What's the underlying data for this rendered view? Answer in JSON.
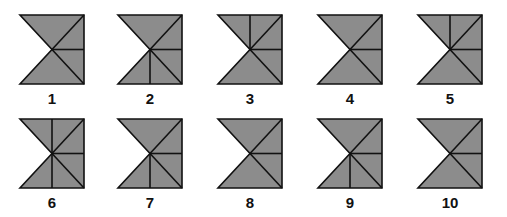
{
  "colors": {
    "fill": "#8c8c8c",
    "stroke": "#111111",
    "background": "#ffffff"
  },
  "figures": [
    {
      "label": "1",
      "vertical_up": false,
      "vertical_down": false,
      "horizontal_right": true
    },
    {
      "label": "2",
      "vertical_up": false,
      "vertical_down": true,
      "horizontal_right": true
    },
    {
      "label": "3",
      "vertical_up": true,
      "vertical_down": false,
      "horizontal_right": true
    },
    {
      "label": "4",
      "vertical_up": false,
      "vertical_down": false,
      "horizontal_right": true
    },
    {
      "label": "5",
      "vertical_up": true,
      "vertical_down": false,
      "horizontal_right": true
    },
    {
      "label": "6",
      "vertical_up": true,
      "vertical_down": true,
      "horizontal_right": true
    },
    {
      "label": "7",
      "vertical_up": false,
      "vertical_down": true,
      "horizontal_right": true
    },
    {
      "label": "8",
      "vertical_up": false,
      "vertical_down": false,
      "horizontal_right": true
    },
    {
      "label": "9",
      "vertical_up": false,
      "vertical_down": true,
      "horizontal_right": true
    },
    {
      "label": "10",
      "vertical_up": false,
      "vertical_down": false,
      "horizontal_right": true
    }
  ]
}
